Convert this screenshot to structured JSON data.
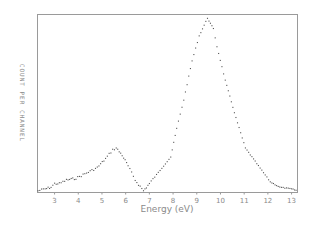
{
  "chart_data": {
    "type": "scatter",
    "title": "",
    "xlabel": "Energy (eV)",
    "ylabel": "COUNT PER CHANNEL",
    "xlim": [
      2.28,
      13.25
    ],
    "ylim": [
      0,
      100
    ],
    "x_ticks": [
      3,
      4,
      5,
      6,
      7,
      8,
      9,
      10,
      11,
      12,
      13
    ],
    "x_tick_labels": [
      "3",
      "4",
      "5",
      "6",
      "7",
      "8",
      "9",
      "10",
      "11",
      "12",
      "13"
    ],
    "y_ticks": [],
    "grid": false,
    "legend": null,
    "series": [
      {
        "name": "spectrum",
        "marker": "dot",
        "color": "#555555",
        "x": [
          2.3,
          2.6,
          2.85,
          3.0,
          3.2,
          3.5,
          3.9,
          4.2,
          4.5,
          4.8,
          5.15,
          5.45,
          5.6,
          5.85,
          6.1,
          6.4,
          6.75,
          7.0,
          7.3,
          7.6,
          7.9,
          8.15,
          8.45,
          8.8,
          9.1,
          9.45,
          9.7,
          9.85,
          10.2,
          10.65,
          11.05,
          11.6,
          12.1,
          12.5,
          13.0,
          13.25
        ],
        "y": [
          1,
          2,
          3,
          5,
          5,
          7,
          8,
          10,
          12,
          14,
          19,
          24,
          25,
          21,
          15,
          7,
          1,
          5,
          10,
          15,
          20,
          36,
          52,
          74,
          88,
          98,
          92,
          82,
          63,
          42,
          25,
          15,
          6,
          3,
          2,
          1
        ]
      }
    ],
    "annotations": []
  },
  "axes": {
    "xlabel": "Energy (eV)",
    "ylabel": "COUNT PER CHANNEL"
  }
}
